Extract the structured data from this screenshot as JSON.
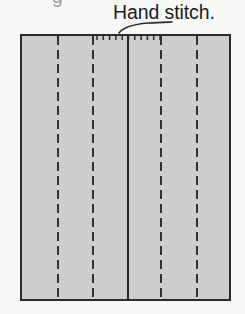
{
  "figure": {
    "kind": "sewing-construction-diagram",
    "clipped_text_above": "g",
    "annotation": {
      "label": "Hand stitch.",
      "leader_line": "curved pointer from label down-left to the stitched top edge"
    },
    "colors": {
      "background": "#f8f8f6",
      "fabric_fill": "#cdcdcd",
      "outline": "#2b2b2b",
      "dash_line": "#2b2b2b",
      "seam_line": "#1e1e1e",
      "stitch_tick": "#2b2b2b",
      "leader_line": "#2b2b2b",
      "text": "#1c1c1c"
    },
    "fabric_rect": {
      "x": 20,
      "y": 34,
      "width": 211,
      "height": 267,
      "stroke_width": 2
    },
    "fold_lines": [
      {
        "name": "fold-line-1",
        "x": 58,
        "style": "dashed"
      },
      {
        "name": "fold-line-2",
        "x": 93,
        "style": "dashed"
      },
      {
        "name": "fold-line-3",
        "x": 161,
        "style": "dashed"
      },
      {
        "name": "fold-line-4",
        "x": 197,
        "style": "dashed"
      }
    ],
    "seam_lines": [
      {
        "name": "center-seam-line",
        "x": 128,
        "style": "solid"
      }
    ],
    "dash_pattern": {
      "dash": 9,
      "gap": 5
    },
    "hand_stitches": {
      "edge": "top",
      "start_x": 97,
      "end_x": 160,
      "spacing": 6,
      "tick_length": 5,
      "count": 11
    }
  }
}
